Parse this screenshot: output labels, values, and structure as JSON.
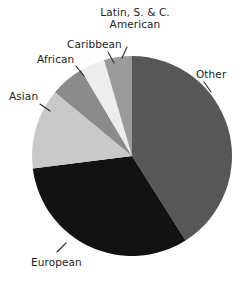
{
  "chart_data": {
    "type": "pie",
    "title": "",
    "subtitle": "",
    "xlabel": "",
    "ylabel": "",
    "legend_position": "none",
    "labels_position": "outside-with-leader-lines",
    "grid": false,
    "start_angle_deg": 0,
    "direction": "clockwise",
    "categories": [
      "Other",
      "European",
      "Asian",
      "African",
      "Caribbean",
      "Latin, S. & C. American"
    ],
    "values": [
      41.0,
      32.0,
      13.0,
      5.5,
      4.0,
      4.5
    ],
    "units": "percent",
    "slices": [
      {
        "label": "Other",
        "value": 41.0,
        "start_angle_deg": 0,
        "end_angle_deg": 147.6,
        "color": "#575757",
        "label_line1": "Other",
        "label_line2": ""
      },
      {
        "label": "European",
        "value": 32.0,
        "start_angle_deg": 147.6,
        "end_angle_deg": 262.8,
        "color": "#121212",
        "label_line1": "European",
        "label_line2": ""
      },
      {
        "label": "Asian",
        "value": 13.0,
        "start_angle_deg": 262.8,
        "end_angle_deg": 309.6,
        "color": "#c9c9c9",
        "label_line1": "Asian",
        "label_line2": ""
      },
      {
        "label": "African",
        "value": 5.5,
        "start_angle_deg": 309.6,
        "end_angle_deg": 329.4,
        "color": "#8b8b8b",
        "label_line1": "African",
        "label_line2": ""
      },
      {
        "label": "Caribbean",
        "value": 4.0,
        "start_angle_deg": 329.4,
        "end_angle_deg": 343.8,
        "color": "#ededed",
        "label_line1": "Caribbean",
        "label_line2": ""
      },
      {
        "label": "Latin, S. & C. American",
        "value": 4.5,
        "start_angle_deg": 343.8,
        "end_angle_deg": 360.0,
        "color": "#9b9b9b",
        "label_line1": "Latin, S. & C.",
        "label_line2": "American"
      }
    ]
  },
  "labels": {
    "latin_line1": "Latin, S. & C.",
    "latin_line2": "American",
    "caribbean": "Caribbean",
    "african": "African",
    "asian": "Asian",
    "other": "Other",
    "european": "European"
  },
  "colors": {
    "other": "#575757",
    "european": "#121212",
    "asian": "#c9c9c9",
    "african": "#8b8b8b",
    "caribbean": "#ededed",
    "latin": "#9b9b9b",
    "background": "#ffffff",
    "text": "#1d1d1d",
    "leader_line": "#2b2b2b"
  }
}
